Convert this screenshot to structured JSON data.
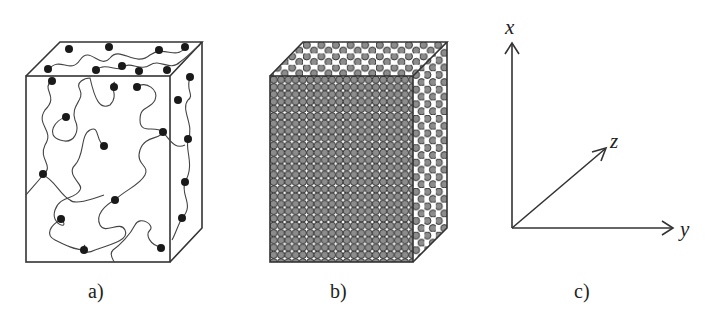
{
  "panels": [
    {
      "id": "a",
      "label": "a)",
      "description": "polymer chain network in a box with crosslink dots"
    },
    {
      "id": "b",
      "label": "b)",
      "description": "densely packed spheres in a box"
    },
    {
      "id": "c",
      "label": "c)",
      "description": "coordinate axes"
    }
  ],
  "axes": {
    "x": "x",
    "y": "y",
    "z": "z"
  },
  "colors": {
    "line": "#333333",
    "dot": "#1a1a1a",
    "sphere": "#8c8c8c"
  }
}
